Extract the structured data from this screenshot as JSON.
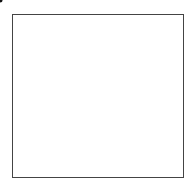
{
  "grid": {
    "rows": 6,
    "cols": 6,
    "cells": [
      [
        "1",
        "6",
        "",
        "",
        "",
        ""
      ],
      [
        "1",
        "5",
        "15",
        "",
        "",
        ""
      ],
      [
        "1",
        "4",
        "10",
        "20",
        "",
        ""
      ],
      [
        "1",
        "3",
        "6",
        "10",
        "15",
        ""
      ],
      [
        "1",
        "2",
        "3",
        "4",
        "5",
        "6"
      ],
      [
        "",
        "1",
        "1",
        "1",
        "1",
        "1"
      ]
    ]
  },
  "outside_labels": {
    "top_left": "1",
    "bottom_right": "1"
  },
  "marker": {
    "row_line": 4,
    "col_line": 4,
    "color": "#111111"
  }
}
